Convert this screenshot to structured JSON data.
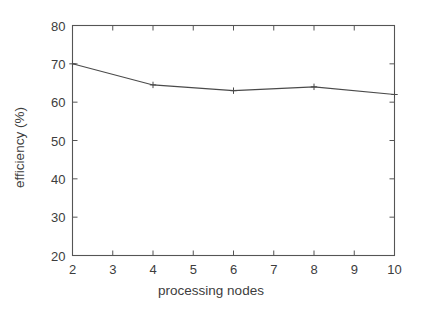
{
  "chart_data": {
    "type": "line",
    "title": "",
    "subtitle": "",
    "xlabel": "processing nodes",
    "ylabel": "efficiency (%)",
    "x": [
      2,
      4,
      6,
      8,
      10
    ],
    "values": [
      70,
      64.5,
      63,
      64,
      62
    ],
    "series": [
      {
        "name": "efficiency",
        "x": [
          2,
          4,
          6,
          8,
          10
        ],
        "values": [
          70,
          64.5,
          63,
          64,
          62
        ]
      }
    ],
    "xlim": [
      2,
      10
    ],
    "ylim": [
      20,
      80
    ],
    "xticks": [
      2,
      3,
      4,
      5,
      6,
      7,
      8,
      9,
      10
    ],
    "xtick_labels": [
      "2",
      "3",
      "4",
      "5",
      "6",
      "7",
      "8",
      "9",
      "10"
    ],
    "yticks": [
      20,
      30,
      40,
      50,
      60,
      70,
      80
    ],
    "ytick_labels": [
      "20",
      "30",
      "40",
      "50",
      "60",
      "70",
      "80"
    ],
    "grid": false,
    "legend": null,
    "legend_position": "none",
    "annotations": [],
    "marker": "plus",
    "line_color": "#4a4a4a",
    "axis_color": "#555555",
    "background_color": "#ffffff"
  }
}
